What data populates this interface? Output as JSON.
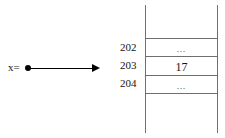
{
  "diagram": {
    "type": "pointer-to-memory-cell",
    "pointer": {
      "variable_label": "x=",
      "dot_marker": "filled-circle",
      "arrow_direction": "right"
    },
    "memory": {
      "addresses": [
        "202",
        "203",
        "204"
      ],
      "cells": [
        {
          "address": "202",
          "value": "…"
        },
        {
          "address": "203",
          "value": "17"
        },
        {
          "address": "204",
          "value": "…"
        }
      ]
    },
    "colors": {
      "line": "#6f6f6f",
      "arrow": "#000000",
      "text": "#141414",
      "background": "#ffffff"
    }
  }
}
